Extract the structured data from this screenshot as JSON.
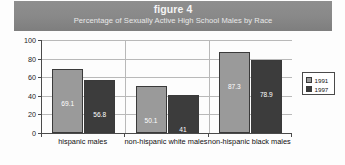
{
  "title": {
    "main": "figure 4",
    "subtitle": "Percentage of Sexually Active High School Males by Race"
  },
  "legend": {
    "items": [
      {
        "label": "1991",
        "color": "#9a9a9a"
      },
      {
        "label": "1997",
        "color": "#3c3c3c"
      }
    ]
  },
  "axis": {
    "y_ticks": [
      "0",
      "20",
      "40",
      "60",
      "80",
      "100"
    ]
  },
  "chart_data": {
    "type": "bar",
    "title": "Percentage of Sexually Active High School Males by Race",
    "subtitle": "figure 4",
    "xlabel": "",
    "ylabel": "",
    "ylim": [
      0,
      100
    ],
    "yticks": [
      0,
      20,
      40,
      60,
      80,
      100
    ],
    "grid": true,
    "legend_position": "right",
    "categories": [
      "hispanic males",
      "non-hispanic white males",
      "non-hispanic black males"
    ],
    "series": [
      {
        "name": "1991",
        "color": "#9a9a9a",
        "values": [
          69.1,
          50.1,
          87.3
        ],
        "labels": [
          "69.1",
          "50.1",
          "87.3"
        ]
      },
      {
        "name": "1997",
        "color": "#3c3c3c",
        "values": [
          56.8,
          41,
          78.9
        ],
        "labels": [
          "56.8",
          "41",
          "78.9"
        ]
      }
    ]
  }
}
